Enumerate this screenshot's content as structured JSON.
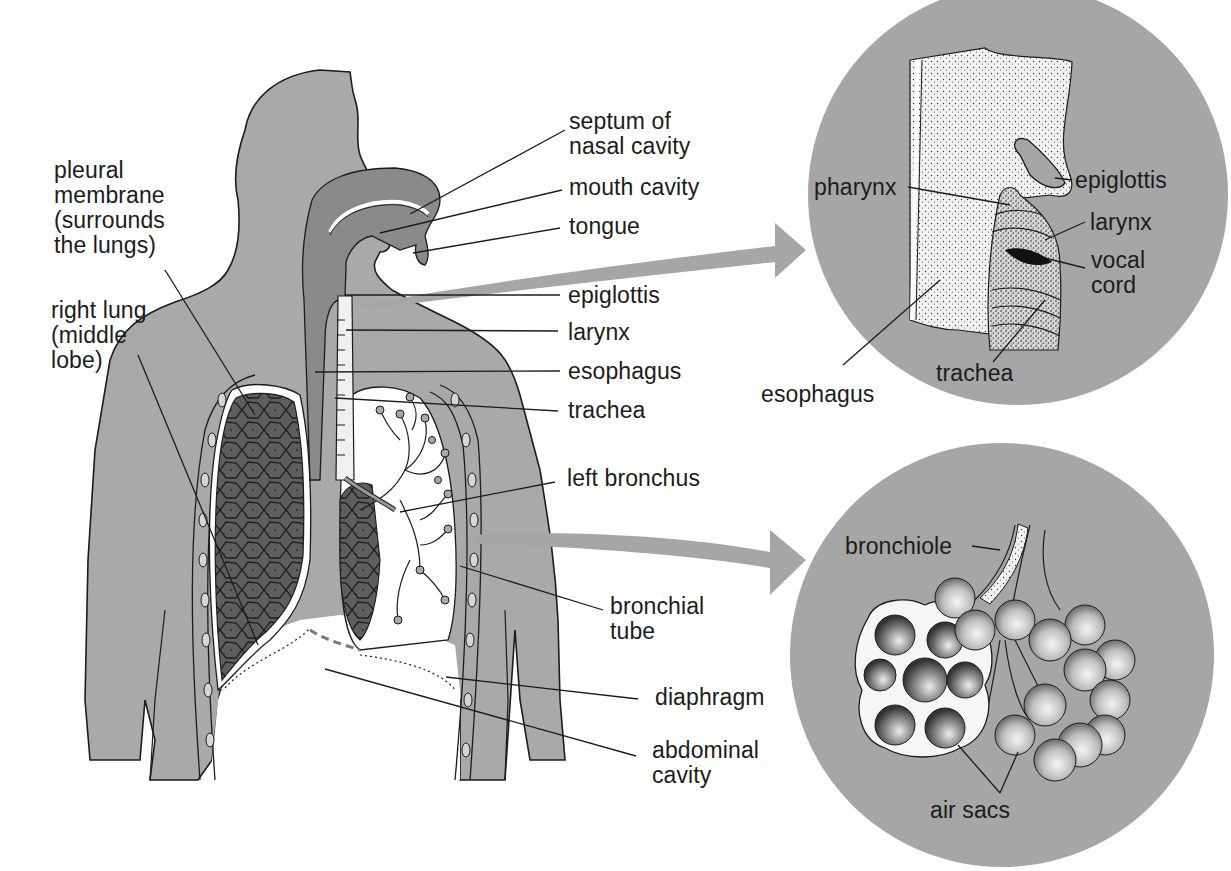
{
  "diagram": {
    "type": "anatomical-illustration",
    "colors": {
      "background": "#ffffff",
      "body_fill": "#a9a9a9",
      "airway_fill": "#8a8a8a",
      "lung_fill": "#5e5e5e",
      "inset_circle_fill": "#a6a6a6",
      "arrow_fill": "#a6a6a6",
      "line": "#1c1c1c",
      "text": "#1c1c1c"
    },
    "main_figure": {
      "left_labels": [
        {
          "id": "pleural-membrane",
          "text": "pleural\nmembrane\n(surrounds\nthe lungs)"
        },
        {
          "id": "right-lung",
          "text": "right lung\n(middle\nlobe)"
        }
      ],
      "right_labels": [
        {
          "id": "septum",
          "text": "septum of\nnasal cavity"
        },
        {
          "id": "mouth-cavity",
          "text": "mouth cavity"
        },
        {
          "id": "tongue",
          "text": "tongue"
        },
        {
          "id": "epiglottis",
          "text": "epiglottis"
        },
        {
          "id": "larynx",
          "text": "larynx"
        },
        {
          "id": "esophagus",
          "text": "esophagus"
        },
        {
          "id": "trachea",
          "text": "trachea"
        },
        {
          "id": "left-bronchus",
          "text": "left bronchus"
        },
        {
          "id": "bronchial-tube",
          "text": "bronchial\ntube"
        },
        {
          "id": "diaphragm",
          "text": "diaphragm"
        },
        {
          "id": "abdominal-cavity",
          "text": "abdominal\ncavity"
        }
      ]
    },
    "inset_throat": {
      "labels": [
        {
          "id": "pharynx",
          "text": "pharynx"
        },
        {
          "id": "epiglottis",
          "text": "epiglottis"
        },
        {
          "id": "larynx",
          "text": "larynx"
        },
        {
          "id": "vocal-cord",
          "text": "vocal\ncord"
        },
        {
          "id": "trachea",
          "text": "trachea"
        },
        {
          "id": "esophagus",
          "text": "esophagus"
        }
      ]
    },
    "inset_alveoli": {
      "labels": [
        {
          "id": "bronchiole",
          "text": "bronchiole"
        },
        {
          "id": "air-sacs",
          "text": "air sacs"
        }
      ]
    }
  }
}
